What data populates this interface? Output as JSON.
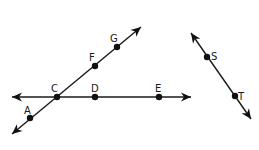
{
  "diagram": {
    "lines": [
      {
        "id": "line-CE",
        "points": [
          "C",
          "D",
          "E"
        ],
        "from": [
          12,
          97
        ],
        "to": [
          191,
          97
        ]
      },
      {
        "id": "line-AG",
        "points": [
          "A",
          "C",
          "F",
          "G"
        ],
        "from": [
          12,
          134
        ],
        "to": [
          141,
          27
        ]
      },
      {
        "id": "line-ST",
        "points": [
          "S",
          "T"
        ],
        "from": [
          191,
          33
        ],
        "to": [
          251,
          119
        ]
      }
    ],
    "points": [
      {
        "name": "A",
        "x": 30,
        "y": 118,
        "label": "A",
        "lx": 24,
        "ly": 114
      },
      {
        "name": "C",
        "x": 57,
        "y": 97,
        "label": "C",
        "lx": 51,
        "ly": 92
      },
      {
        "name": "D",
        "x": 95,
        "y": 97,
        "label": "D",
        "lx": 91,
        "ly": 92
      },
      {
        "name": "E",
        "x": 159,
        "y": 97,
        "label": "E",
        "lx": 155,
        "ly": 92
      },
      {
        "name": "F",
        "x": 95,
        "y": 66,
        "label": "F",
        "lx": 89,
        "ly": 61
      },
      {
        "name": "G",
        "x": 117,
        "y": 47,
        "label": "G",
        "lx": 110,
        "ly": 42
      },
      {
        "name": "S",
        "x": 207,
        "y": 57,
        "label": "S",
        "lx": 211,
        "ly": 60
      },
      {
        "name": "T",
        "x": 235,
        "y": 96,
        "label": "T",
        "lx": 238,
        "ly": 100
      }
    ],
    "colors": {
      "stroke": "#1a1a1a",
      "point": "#111111",
      "background": "#ffffff"
    }
  }
}
